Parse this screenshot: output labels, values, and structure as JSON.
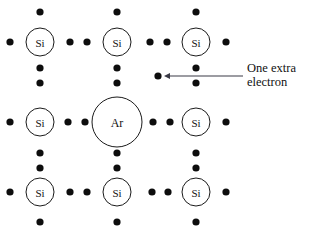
{
  "figure": {
    "background_color": "#ffffff",
    "width": 315,
    "height": 236
  },
  "style": {
    "atom_stroke": "#1a1a1a",
    "atom_fill": "#ffffff",
    "electron_color": "#0d0d0d",
    "annotation_color": "#3a3a46",
    "text_color": "#111111",
    "electron_radius": 3.6,
    "si_radius": 14,
    "ar_radius": 25,
    "si_font_size": 11,
    "ar_font_size": 12
  },
  "atoms": [
    {
      "name": "si-top-left",
      "label": "Si",
      "cx": 40,
      "cy": 42,
      "r": 14,
      "font": 11
    },
    {
      "name": "si-top-center",
      "label": "Si",
      "cx": 117,
      "cy": 42,
      "r": 14,
      "font": 11
    },
    {
      "name": "si-top-right",
      "label": "Si",
      "cx": 196,
      "cy": 42,
      "r": 14,
      "font": 11
    },
    {
      "name": "si-middle-left",
      "label": "Si",
      "cx": 40,
      "cy": 122,
      "r": 14,
      "font": 11
    },
    {
      "name": "ar-center",
      "label": "Ar",
      "cx": 117,
      "cy": 122,
      "r": 25,
      "font": 12
    },
    {
      "name": "si-middle-right",
      "label": "Si",
      "cx": 196,
      "cy": 122,
      "r": 14,
      "font": 11
    },
    {
      "name": "si-bottom-left",
      "label": "Si",
      "cx": 40,
      "cy": 192,
      "r": 14,
      "font": 11
    },
    {
      "name": "si-bottom-center",
      "label": "Si",
      "cx": 117,
      "cy": 192,
      "r": 14,
      "font": 11
    },
    {
      "name": "si-bottom-right",
      "label": "Si",
      "cx": 196,
      "cy": 192,
      "r": 14,
      "font": 11
    }
  ],
  "electrons": [
    {
      "name": "electron-top-left-above",
      "cx": 40,
      "cy": 12
    },
    {
      "name": "electron-top-center-above",
      "cx": 117,
      "cy": 12
    },
    {
      "name": "electron-top-right-above",
      "cx": 196,
      "cy": 12
    },
    {
      "name": "electron-row1-far-left",
      "cx": 10,
      "cy": 42
    },
    {
      "name": "electron-row1-bond-a-left",
      "cx": 70,
      "cy": 42
    },
    {
      "name": "electron-row1-bond-a-right",
      "cx": 87,
      "cy": 42
    },
    {
      "name": "electron-row1-bond-b-left",
      "cx": 150,
      "cy": 42
    },
    {
      "name": "electron-row1-bond-b-right",
      "cx": 167,
      "cy": 42
    },
    {
      "name": "electron-row1-far-right",
      "cx": 226,
      "cy": 42
    },
    {
      "name": "electron-col1-upper-bond-top",
      "cx": 40,
      "cy": 68
    },
    {
      "name": "electron-col1-upper-bond-bottom",
      "cx": 40,
      "cy": 83
    },
    {
      "name": "electron-col2-upper-bond-top",
      "cx": 117,
      "cy": 68
    },
    {
      "name": "electron-col2-upper-bond-bottom",
      "cx": 117,
      "cy": 83
    },
    {
      "name": "electron-col3-upper-bond-top",
      "cx": 196,
      "cy": 68
    },
    {
      "name": "electron-col3-upper-bond-bottom",
      "cx": 196,
      "cy": 83
    },
    {
      "name": "electron-row2-far-left",
      "cx": 10,
      "cy": 122
    },
    {
      "name": "electron-row2-bond-a-left",
      "cx": 68,
      "cy": 122
    },
    {
      "name": "electron-row2-bond-a-right",
      "cx": 85,
      "cy": 122
    },
    {
      "name": "electron-row2-bond-b-left",
      "cx": 153,
      "cy": 122
    },
    {
      "name": "electron-row2-bond-b-right",
      "cx": 170,
      "cy": 122
    },
    {
      "name": "electron-row2-far-right",
      "cx": 226,
      "cy": 122
    },
    {
      "name": "electron-col1-lower-bond-top",
      "cx": 40,
      "cy": 153
    },
    {
      "name": "electron-col1-lower-bond-bottom",
      "cx": 40,
      "cy": 168
    },
    {
      "name": "electron-col2-lower-bond-top",
      "cx": 117,
      "cy": 153
    },
    {
      "name": "electron-col2-lower-bond-bottom",
      "cx": 117,
      "cy": 168
    },
    {
      "name": "electron-col3-lower-bond-top",
      "cx": 196,
      "cy": 153
    },
    {
      "name": "electron-col3-lower-bond-bottom",
      "cx": 196,
      "cy": 168
    },
    {
      "name": "electron-row3-far-left",
      "cx": 10,
      "cy": 192
    },
    {
      "name": "electron-row3-bond-a-left",
      "cx": 70,
      "cy": 192
    },
    {
      "name": "electron-row3-bond-a-right",
      "cx": 87,
      "cy": 192
    },
    {
      "name": "electron-row3-bond-b-left",
      "cx": 152,
      "cy": 192
    },
    {
      "name": "electron-row3-bond-b-right",
      "cx": 168,
      "cy": 192
    },
    {
      "name": "electron-row3-far-right",
      "cx": 226,
      "cy": 192
    },
    {
      "name": "electron-bottom-left-below",
      "cx": 40,
      "cy": 222
    },
    {
      "name": "electron-bottom-center-below",
      "cx": 117,
      "cy": 222
    },
    {
      "name": "electron-bottom-right-below",
      "cx": 196,
      "cy": 222
    },
    {
      "name": "electron-extra",
      "cx": 158,
      "cy": 76
    }
  ],
  "annotation": {
    "label_line_1": "One extra",
    "label_line_2": "electron",
    "text_x": 247,
    "text_y_line_1": 72,
    "text_y_line_2": 86,
    "arrow_tail_x": 243,
    "arrow_tip_x": 164,
    "arrow_y": 76,
    "arrow_head_size": 5
  }
}
